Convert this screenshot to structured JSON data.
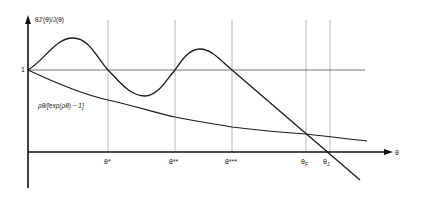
{
  "diagram": {
    "y_axis_label": "θJ′(θ)/J(θ)",
    "y_tick_label": "1",
    "x_axis_label": "θ",
    "curve_label": "ρθ/[exp(ρθ) − 1]",
    "x_ticks": [
      {
        "label": "θ*",
        "x": 108
      },
      {
        "label": "θ**",
        "x": 175
      },
      {
        "label": "θ***",
        "x": 232
      },
      {
        "label": "θF",
        "x": 306
      },
      {
        "label": "θJ",
        "x": 330
      }
    ],
    "x_tick_labels": {
      "theta_star": "θ*",
      "theta_2star": "θ**",
      "theta_3star": "θ***",
      "theta_F_base": "θ",
      "theta_F_sub": "F",
      "theta_J_base": "θ",
      "theta_J_sub": "J"
    },
    "colors": {
      "curve": "#1a1a1a",
      "gridline": "#9a9a9a",
      "axis": "#111111"
    }
  }
}
